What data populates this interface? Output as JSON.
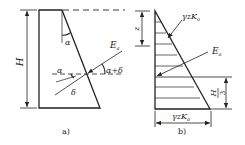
{
  "figure": {
    "panel_a": {
      "caption": "a)",
      "height_label": "H",
      "wall_angle_label": "α",
      "friction_angle_label": "δ",
      "normal_angle_label": "α",
      "force_label": "E",
      "force_subscript": "a",
      "resultant_angle_label": "α+δ"
    },
    "panel_b": {
      "caption": "b)",
      "depth_label": "z",
      "pressure_label_top": "γzK",
      "pressure_subscript_top": "a",
      "force_label": "E",
      "force_subscript": "a",
      "resultant_height_num": "H",
      "resultant_height_den": "3",
      "base_pressure_label": "γzK",
      "base_pressure_subscript": "a"
    }
  },
  "colors": {
    "line": "#222222",
    "background": "#ffffff"
  }
}
